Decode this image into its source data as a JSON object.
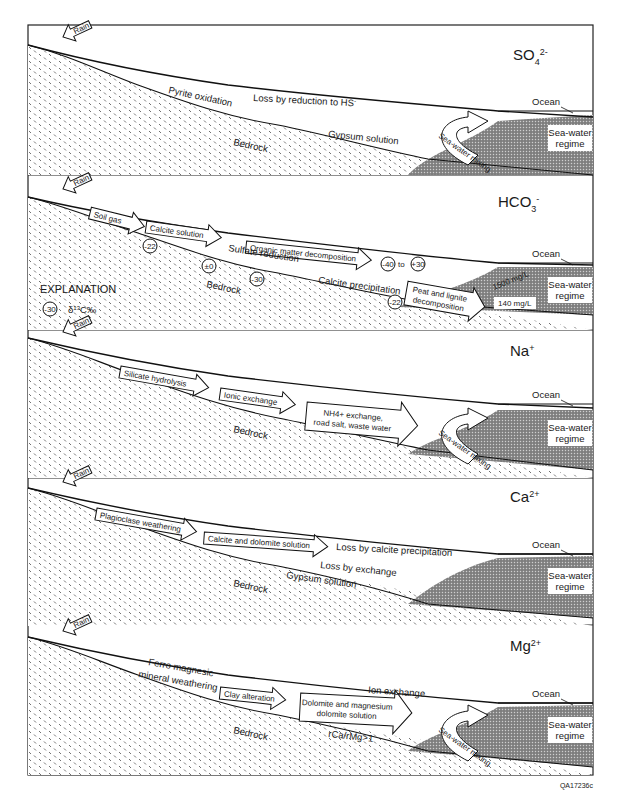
{
  "figure": {
    "code": "QA17236c",
    "common": {
      "rain": "Rain",
      "bedrock": "Bedrock",
      "ocean": "Ocean",
      "sea_water_regime_line1": "Sea-water",
      "sea_water_regime_line2": "regime",
      "sea_water_mixing": "Sea-water mixing"
    },
    "panels": [
      {
        "ion": "SO",
        "ion_sub": "4",
        "ion_sup": "2-",
        "labels": {
          "pyrite": "Pyrite oxidation",
          "loss": "Loss by reduction to HS",
          "loss_sup": "-",
          "gypsum": "Gypsum solution"
        }
      },
      {
        "ion": "HCO",
        "ion_sub": "3",
        "ion_sup": "-",
        "labels": {
          "soil_gas": "Soil gas",
          "calcite_solution": "Calcite solution",
          "organic": "Organic matter decomposition",
          "sulfate_reduction": "Sulfate reduction",
          "calcite_precipitation": "Calcite precipitation",
          "peat_line1": "Peat and lignite",
          "peat_line2": "decomposition",
          "conc_high": "1500 mg/L",
          "conc_low": "140 mg/L",
          "to": "to"
        },
        "isotope_values": [
          "-22",
          "±0",
          "-30",
          "-40",
          "+30",
          "-22"
        ],
        "explanation": {
          "title": "EXPLANATION",
          "sample_value": "-30",
          "symbol_text": "δ",
          "symbol_sup": "13",
          "symbol_unit": "C‰"
        }
      },
      {
        "ion": "Na",
        "ion_sub": "",
        "ion_sup": "+",
        "labels": {
          "silicate": "Silicate hydrolysis",
          "ionic": "Ionic exchange",
          "nh4_line1": "NH4+ exchange,",
          "nh4_line2": "road salt, waste water"
        }
      },
      {
        "ion": "Ca",
        "ion_sub": "",
        "ion_sup": "2+",
        "labels": {
          "plagioclase": "Plagioclase weathering",
          "calcite_dolomite": "Calcite and dolomite solution",
          "loss_calcite": "Loss by calcite precipitation",
          "loss_exchange": "Loss by exchange",
          "gypsum": "Gypsum solution"
        }
      },
      {
        "ion": "Mg",
        "ion_sub": "",
        "ion_sup": "2+",
        "labels": {
          "ferro_line1": "Ferro magnesic",
          "ferro_line2": "mineral weathering",
          "clay": "Clay alteration",
          "dolomite_line1": "Dolomite and magnesium",
          "dolomite_line2": "dolomite solution",
          "ion_exchange": "Ion exchange",
          "ratio": "rCa/rMg>1"
        }
      }
    ]
  }
}
